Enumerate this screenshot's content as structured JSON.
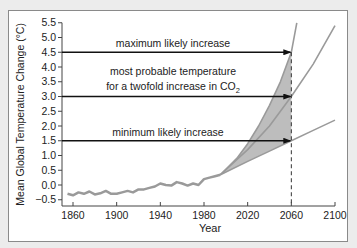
{
  "chart_data": {
    "type": "line",
    "title": "",
    "xlabel": "Year",
    "ylabel": "Mean Global Temperature Change (°C)",
    "xlim": [
      1850,
      2100
    ],
    "ylim": [
      -0.5,
      5.5
    ],
    "xticks": [
      1860,
      1900,
      1940,
      1980,
      2020,
      2060,
      2100
    ],
    "yticks": [
      -0.5,
      0.0,
      0.5,
      1.0,
      1.5,
      2.0,
      2.5,
      3.0,
      3.5,
      4.0,
      4.5,
      5.0,
      5.5
    ],
    "ytick_labels": [
      "-0.5",
      "0.0",
      "0.5",
      "1.0",
      "1.5",
      "2.0",
      "2.5",
      "3.0",
      "3.5",
      "4.0",
      "4.5",
      "5.0",
      "5.5"
    ],
    "grid": false,
    "series": [
      {
        "name": "historical",
        "x": [
          1855,
          1860,
          1865,
          1870,
          1875,
          1880,
          1885,
          1890,
          1895,
          1900,
          1905,
          1910,
          1915,
          1920,
          1925,
          1930,
          1935,
          1940,
          1945,
          1950,
          1955,
          1960,
          1965,
          1970,
          1975,
          1980,
          1985,
          1990,
          1995
        ],
        "values": [
          -0.3,
          -0.35,
          -0.25,
          -0.3,
          -0.22,
          -0.32,
          -0.28,
          -0.2,
          -0.3,
          -0.3,
          -0.25,
          -0.2,
          -0.25,
          -0.15,
          -0.15,
          -0.1,
          -0.05,
          0.05,
          0.0,
          -0.02,
          0.1,
          0.05,
          -0.02,
          0.05,
          0.0,
          0.2,
          0.25,
          0.3,
          0.35
        ]
      },
      {
        "name": "maximum likely increase",
        "x": [
          1995,
          2010,
          2020,
          2030,
          2040,
          2050,
          2060,
          2065
        ],
        "values": [
          0.35,
          0.9,
          1.4,
          2.0,
          2.7,
          3.5,
          4.5,
          5.5
        ]
      },
      {
        "name": "most probable",
        "x": [
          1995,
          2020,
          2040,
          2060,
          2080,
          2100
        ],
        "values": [
          0.35,
          1.2,
          2.0,
          3.0,
          4.1,
          5.4
        ]
      },
      {
        "name": "minimum likely increase",
        "x": [
          1995,
          2020,
          2040,
          2060,
          2080,
          2100
        ],
        "values": [
          0.35,
          0.8,
          1.15,
          1.5,
          1.85,
          2.2
        ]
      }
    ],
    "annotations": [
      {
        "text": "maximum likely increase",
        "arrow_to": [
          2060,
          4.5
        ]
      },
      {
        "text": "most probable temperature for a twofold increase in CO2",
        "arrow_to": [
          2060,
          3.0
        ]
      },
      {
        "text": "minimum likely increase",
        "arrow_to": [
          2060,
          1.5
        ]
      }
    ],
    "shaded_region": {
      "between": [
        "maximum likely increase",
        "minimum likely increase"
      ],
      "x_range": [
        1995,
        2060
      ]
    },
    "reference_line": {
      "type": "vertical-dashed",
      "x": 2060
    }
  },
  "labels": {
    "ylabel": "Mean Global Temperature Change (°C)",
    "xlabel": "Year",
    "max": "maximum likely increase",
    "mostprob_line1": "most probable temperature",
    "mostprob_line2_pre": "for a twofold increase in CO",
    "mostprob_sub": "2",
    "min": "minimum likely increase"
  }
}
